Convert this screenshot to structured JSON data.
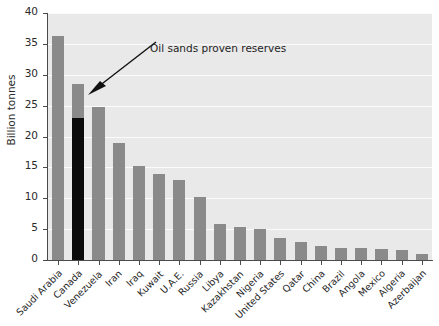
{
  "chart_data": {
    "type": "bar",
    "title": "",
    "xlabel": "",
    "ylabel": "Billion tonnes",
    "ylim": [
      0,
      40
    ],
    "ytick_values": [
      0,
      5,
      10,
      15,
      20,
      25,
      30,
      35,
      40
    ],
    "ytick_labels": [
      "0",
      "5",
      "10",
      "15",
      "20",
      "25",
      "30",
      "35",
      "40"
    ],
    "grid": true,
    "legend": "none",
    "categories": [
      "Saudi Arabia",
      "Canada",
      "Venezuela",
      "Iran",
      "Iraq",
      "Kuwait",
      "U.A.E.",
      "Russia",
      "Libya",
      "Kazakhstan",
      "Nigeria",
      "United States",
      "Qatar",
      "China",
      "Brazil",
      "Angola",
      "Mexico",
      "Algeria",
      "Azerbaijan"
    ],
    "values": [
      36.2,
      28.5,
      24.8,
      18.9,
      15.3,
      14.0,
      13.0,
      10.2,
      5.8,
      5.4,
      5.1,
      3.5,
      2.9,
      2.2,
      2.0,
      2.0,
      1.8,
      1.7,
      1.0
    ],
    "highlight": {
      "category": "Canada",
      "index": 1,
      "value": 23.0,
      "label": "Oil sands proven reserves",
      "color": "#0b0b0b"
    },
    "annotations": [
      {
        "text": "Oil sands proven reserves",
        "points_to_category": "Canada",
        "points_to_value": 23.0
      }
    ],
    "colors": {
      "bar": "#8a8a8a",
      "highlight_bar": "#0b0b0b",
      "plot_background": "#e9e9e9",
      "gridline": "#fbfbfb",
      "axis": "#4a4a4a",
      "text": "#1f1f1f"
    }
  }
}
